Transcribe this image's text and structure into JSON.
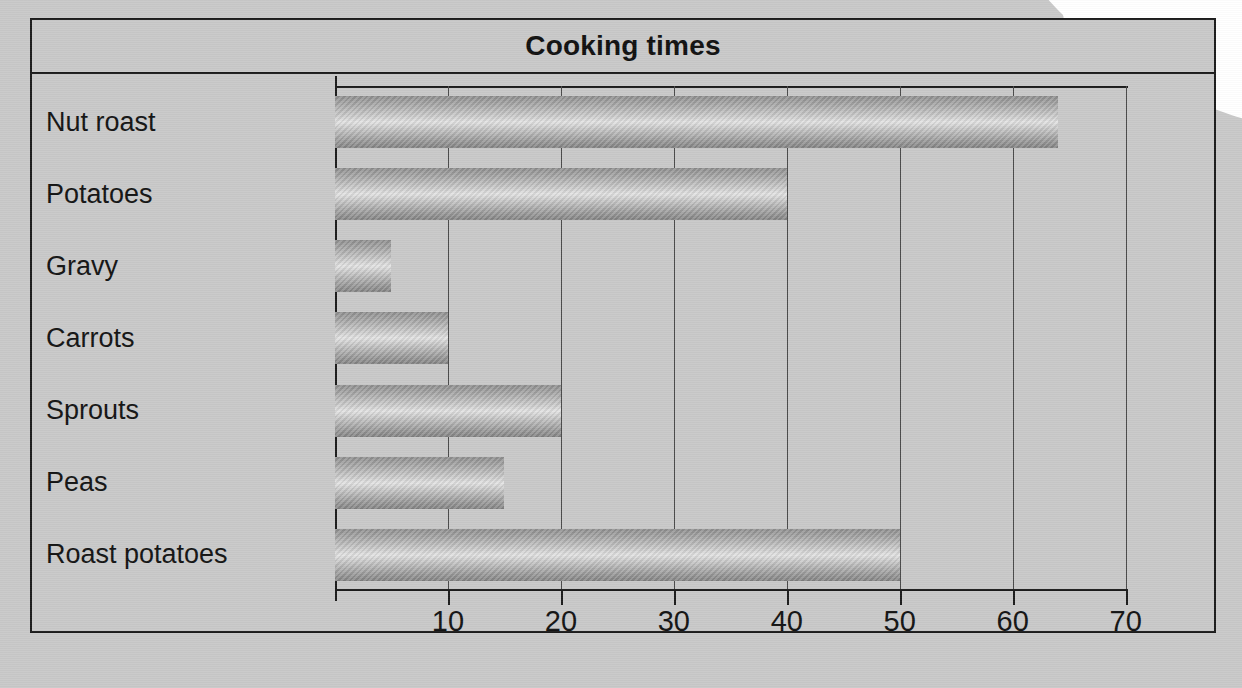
{
  "chart_data": {
    "type": "bar",
    "orientation": "horizontal",
    "title": "Cooking times",
    "xlabel": "",
    "ylabel": "",
    "categories": [
      "Nut roast",
      "Potatoes",
      "Gravy",
      "Carrots",
      "Sprouts",
      "Peas",
      "Roast potatoes"
    ],
    "values": [
      64,
      40,
      5,
      10,
      20,
      15,
      50
    ],
    "xlim": [
      0,
      78
    ],
    "xticks": [
      10,
      20,
      30,
      40,
      50,
      60,
      70
    ],
    "xtick_labels": [
      "10",
      "20",
      "30",
      "40",
      "50",
      "60",
      "70"
    ],
    "grid": "vertical",
    "legend": "none",
    "colors": {
      "background": "#c9c9c9",
      "frame": "#1c1c1c",
      "gridline": "#4a4a4a",
      "bar_light": "#e3e3e3",
      "bar_dark": "#838383",
      "text": "#141414"
    }
  },
  "ghost_text": {
    "line1": "",
    "line2": ""
  }
}
